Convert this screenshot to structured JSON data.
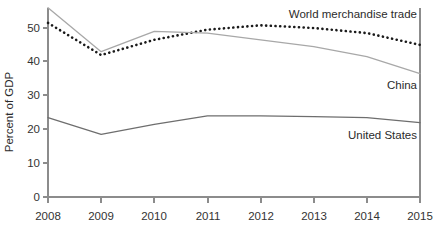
{
  "chart_data": {
    "type": "line",
    "title": "",
    "xlabel": "",
    "ylabel": "Percent of GDP",
    "x": [
      2008,
      2009,
      2010,
      2011,
      2012,
      2013,
      2014,
      2015
    ],
    "xtick_labels": [
      "2008",
      "2009",
      "2010",
      "2011",
      "2012",
      "2013",
      "2014",
      "2015"
    ],
    "ytick_labels": [
      "0",
      "10",
      "20",
      "30",
      "40",
      "50"
    ],
    "yticks": [
      0,
      10,
      20,
      30,
      40,
      50
    ],
    "ylim": [
      0,
      58
    ],
    "xlim": [
      2008,
      2015
    ],
    "grid": false,
    "legend_position": "inline-right",
    "series": [
      {
        "name": "World merchandise trade",
        "style": "dotted",
        "color": "#1a1a1a",
        "values": [
          51.5,
          42.0,
          46.5,
          49.5,
          50.8,
          50.0,
          48.5,
          45.0
        ],
        "label_x": 2014.0,
        "label_y": 55.5,
        "label_anchor": "end"
      },
      {
        "name": "China",
        "style": "solid",
        "color": "#a8a8a8",
        "values": [
          56.0,
          43.0,
          49.0,
          48.5,
          46.5,
          44.5,
          41.5,
          36.5
        ],
        "label_x": 2015.0,
        "label_y": 33.0,
        "label_anchor": "end"
      },
      {
        "name": "United States",
        "style": "solid",
        "color": "#6e6e6e",
        "values": [
          23.5,
          18.5,
          21.5,
          24.0,
          24.0,
          23.8,
          23.5,
          22.0
        ],
        "label_x": 2015.0,
        "label_y": 18.5,
        "label_anchor": "end"
      }
    ]
  },
  "axis": {
    "y_title": "Percent of GDP"
  },
  "labels": {
    "world": "World merchandise trade",
    "china": "China",
    "united_states": "United States"
  },
  "yticks": {
    "t0": "0",
    "t1": "10",
    "t2": "20",
    "t3": "30",
    "t4": "40",
    "t5": "50"
  },
  "xticks": {
    "t0": "2008",
    "t1": "2009",
    "t2": "2010",
    "t3": "2011",
    "t4": "2012",
    "t5": "2013",
    "t6": "2014",
    "t7": "2015"
  },
  "colors": {
    "world_line": "#1a1a1a",
    "china_line": "#a8a8a8",
    "us_line": "#6e6e6e",
    "axis": "#8c8c8c",
    "text": "#2b2b2b",
    "background": "#ffffff"
  }
}
